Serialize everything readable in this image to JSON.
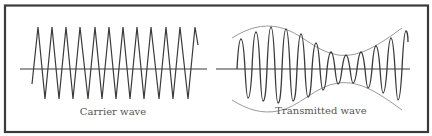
{
  "figure": {
    "border_color": "#3a3a3a",
    "line_color": "#3a3a3a",
    "envelope_color": "#9a9a9a",
    "text_color": "#555555"
  },
  "panels": [
    {
      "id": "carrier",
      "label": "Carrier wave",
      "description": "Constant-amplitude carrier wave (triangular zig-zag) about a horizontal axis"
    },
    {
      "id": "transmitted",
      "label": "Transmitted wave",
      "description": "Amplitude-modulated wave with envelope curves above and below the axis"
    }
  ]
}
